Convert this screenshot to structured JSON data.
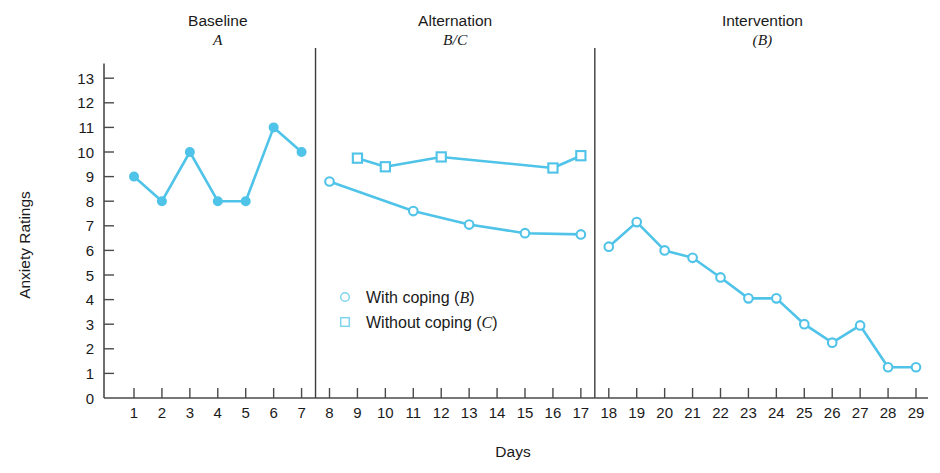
{
  "chart_data": {
    "type": "line",
    "title": "",
    "xlabel": "Days",
    "ylabel": "Anxiety Ratings",
    "xlim": [
      0,
      30
    ],
    "ylim": [
      0,
      13.6
    ],
    "grid": false,
    "legend_position": "inside-center-lower",
    "y_ticks": [
      "0",
      "1",
      "2",
      "3",
      "4",
      "5",
      "6",
      "7",
      "8",
      "9",
      "10",
      "11",
      "12",
      "13"
    ],
    "x_ticks": [
      "1",
      "2",
      "3",
      "4",
      "5",
      "6",
      "7",
      "8",
      "9",
      "10",
      "11",
      "12",
      "13",
      "14",
      "15",
      "16",
      "17",
      "18",
      "19",
      "20",
      "21",
      "22",
      "23",
      "24",
      "25",
      "26",
      "27",
      "28",
      "29"
    ],
    "phase_dividers": [
      7.5,
      17.5
    ],
    "phases": [
      {
        "name": "Baseline",
        "sub": "A",
        "center_day": 4
      },
      {
        "name": "Alternation",
        "sub": "B/C",
        "center_day": 12.5
      },
      {
        "name": "Intervention",
        "sub": "(B)",
        "center_day": 23.5
      }
    ],
    "series": [
      {
        "name": "Baseline (A)",
        "marker": "filled-circle",
        "color": "#4FC3E8",
        "x": [
          1,
          2,
          3,
          4,
          5,
          6,
          7
        ],
        "values": [
          9.0,
          8.0,
          10.0,
          8.0,
          8.0,
          11.0,
          10.0
        ]
      },
      {
        "name": "With coping (B)",
        "marker": "open-circle",
        "color": "#4FC3E8",
        "x": [
          8,
          11,
          13,
          15,
          17
        ],
        "values": [
          8.8,
          7.6,
          7.05,
          6.7,
          6.65
        ]
      },
      {
        "name": "Without coping (C)",
        "marker": "open-square",
        "color": "#4FC3E8",
        "x": [
          9,
          10,
          12,
          16,
          17
        ],
        "values": [
          9.75,
          9.4,
          9.8,
          9.35,
          9.85
        ]
      },
      {
        "name": "Intervention (B)",
        "marker": "open-circle",
        "color": "#4FC3E8",
        "x": [
          18,
          19,
          20,
          21,
          22,
          23,
          24,
          25,
          26,
          27,
          28,
          29
        ],
        "values": [
          6.15,
          7.15,
          6.0,
          5.7,
          4.9,
          4.05,
          4.05,
          3.0,
          2.25,
          2.95,
          1.25,
          1.25
        ]
      }
    ],
    "legend": [
      {
        "marker": "open-circle",
        "label": "With coping (",
        "italic": "B",
        "tail": ")"
      },
      {
        "marker": "open-square",
        "label": "Without coping (",
        "italic": "C",
        "tail": ")"
      }
    ]
  }
}
